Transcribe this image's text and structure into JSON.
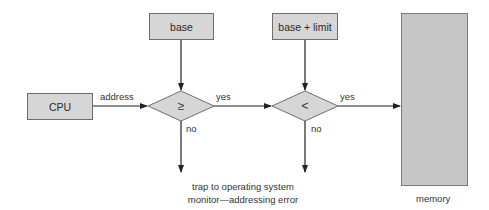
{
  "diagram": {
    "type": "flowchart",
    "nodes": {
      "cpu": {
        "label": "CPU"
      },
      "base": {
        "label": "base"
      },
      "base_limit": {
        "label": "base + limit"
      },
      "compare_ge": {
        "label": "≥"
      },
      "compare_lt": {
        "label": "<"
      },
      "memory": {
        "label": "memory"
      }
    },
    "edges": {
      "address": {
        "label": "address"
      },
      "yes1": {
        "label": "yes"
      },
      "yes2": {
        "label": "yes"
      },
      "no1": {
        "label": "no"
      },
      "no2": {
        "label": "no"
      }
    },
    "trap": {
      "line1": "trap to operating system",
      "line2": "monitor—addressing error"
    },
    "colors": {
      "box_fill": "#d6d6d6",
      "memory_fill": "#c6c6c6",
      "stroke": "#333333"
    }
  }
}
